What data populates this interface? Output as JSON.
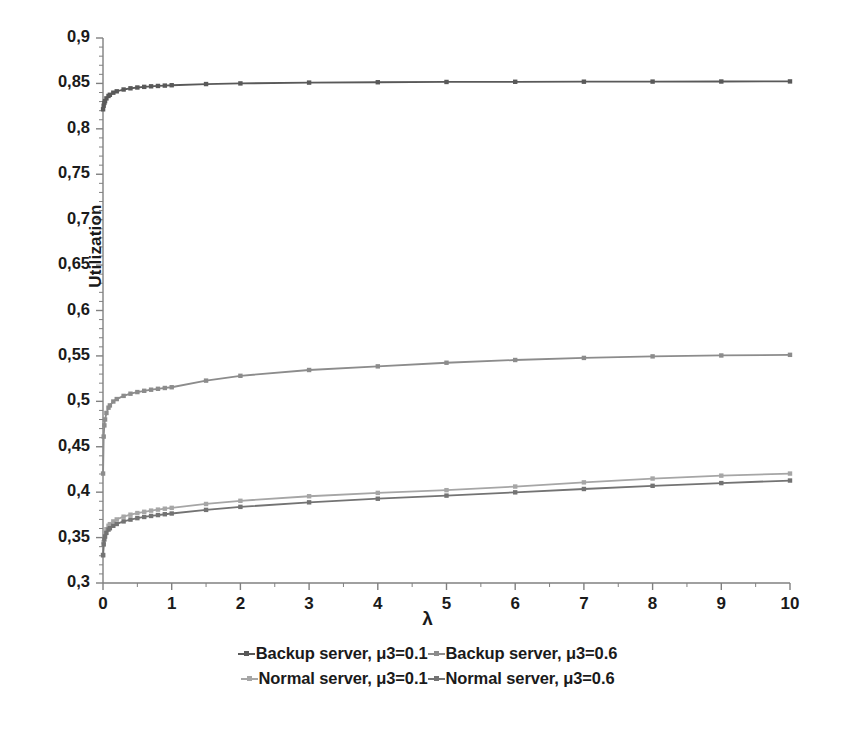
{
  "chart_data": {
    "type": "line",
    "title": "",
    "xlabel": "λ",
    "ylabel": "Utilization",
    "xlim": [
      0,
      10
    ],
    "ylim": [
      0.3,
      0.9
    ],
    "grid": false,
    "legend_position": "bottom",
    "x_ticks": [
      "0",
      "1",
      "2",
      "3",
      "4",
      "5",
      "6",
      "7",
      "8",
      "9",
      "10"
    ],
    "x_tick_values": [
      0,
      1,
      2,
      3,
      4,
      5,
      6,
      7,
      8,
      9,
      10
    ],
    "y_ticks": [
      "0,3",
      "0,35",
      "0,4",
      "0,45",
      "0,5",
      "0,55",
      "0,6",
      "0,65",
      "0,7",
      "0,75",
      "0,8",
      "0,85",
      "0,9"
    ],
    "y_tick_values": [
      0.3,
      0.35,
      0.4,
      0.45,
      0.5,
      0.55,
      0.6,
      0.65,
      0.7,
      0.75,
      0.8,
      0.85,
      0.9
    ],
    "x": [
      0.001,
      0.01,
      0.02,
      0.03,
      0.05,
      0.08,
      0.1,
      0.15,
      0.2,
      0.3,
      0.4,
      0.5,
      0.6,
      0.7,
      0.8,
      0.9,
      1.0,
      1.5,
      2.0,
      3.0,
      4.0,
      5.0,
      6.0,
      7.0,
      8.0,
      9.0,
      10.0
    ],
    "series": [
      {
        "name": "Backup server, μ3=0.1",
        "color": "#595959",
        "marker": "square",
        "values": [
          0.8215,
          0.8255,
          0.8285,
          0.8305,
          0.8335,
          0.8362,
          0.8375,
          0.8398,
          0.8413,
          0.8433,
          0.8446,
          0.8455,
          0.8462,
          0.8468,
          0.8472,
          0.8476,
          0.848,
          0.8493,
          0.85,
          0.8509,
          0.8513,
          0.8516,
          0.8518,
          0.8519,
          0.852,
          0.8521,
          0.8522
        ]
      },
      {
        "name": "Backup server, μ3=0.6",
        "color": "#8c8c8c",
        "marker": "square",
        "values": [
          0.4205,
          0.4612,
          0.4735,
          0.48,
          0.4872,
          0.493,
          0.4955,
          0.4998,
          0.5025,
          0.506,
          0.5084,
          0.5102,
          0.5116,
          0.5128,
          0.5138,
          0.5147,
          0.5155,
          0.5228,
          0.5281,
          0.5345,
          0.5385,
          0.5425,
          0.5455,
          0.5478,
          0.5495,
          0.5505,
          0.5512
        ]
      },
      {
        "name": "Normal server, μ3=0.1",
        "color": "#a6a6a6",
        "marker": "square",
        "values": [
          0.331,
          0.345,
          0.351,
          0.3548,
          0.3592,
          0.363,
          0.3648,
          0.3678,
          0.37,
          0.373,
          0.3752,
          0.377,
          0.3784,
          0.3797,
          0.3808,
          0.3818,
          0.3827,
          0.387,
          0.3905,
          0.3955,
          0.3992,
          0.4022,
          0.4062,
          0.4108,
          0.415,
          0.4182,
          0.4205
        ]
      },
      {
        "name": "Normal server, μ3=0.6",
        "color": "#737373",
        "marker": "square",
        "values": [
          0.3305,
          0.3425,
          0.348,
          0.3512,
          0.3552,
          0.3588,
          0.3603,
          0.363,
          0.365,
          0.3678,
          0.3698,
          0.3714,
          0.3727,
          0.3738,
          0.3748,
          0.3757,
          0.3765,
          0.3805,
          0.3838,
          0.3888,
          0.3928,
          0.3962,
          0.3998,
          0.4035,
          0.407,
          0.41,
          0.4128
        ]
      }
    ]
  },
  "axis": {
    "y_title": "Utilization",
    "x_title": "λ"
  },
  "legend": {
    "rows": [
      [
        {
          "label": "Backup server, μ3=0.1",
          "color": "#595959"
        },
        {
          "label": "Backup server, μ3=0.6",
          "color": "#8c8c8c"
        }
      ],
      [
        {
          "label": "Normal server, μ3=0.1",
          "color": "#a6a6a6"
        },
        {
          "label": "Normal server, μ3=0.6",
          "color": "#737373"
        }
      ]
    ]
  },
  "colors": {
    "background": "#ffffff",
    "axis": "#808080",
    "text": "#1a1a1a"
  }
}
